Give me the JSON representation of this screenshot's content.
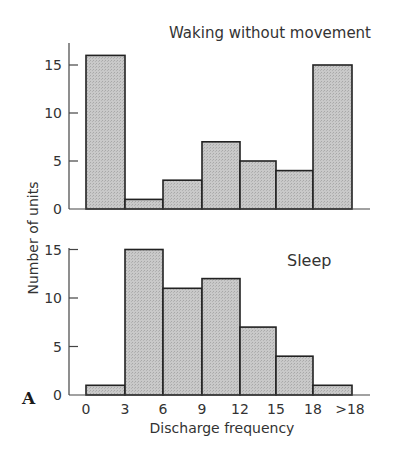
{
  "chart_data": [
    {
      "type": "bar",
      "title": "Waking without movement",
      "xlabel": "Discharge frequency",
      "ylabel": "Number of units",
      "categories": [
        "0-3",
        "3-6",
        "6-9",
        "9-12",
        "12-15",
        "15-18",
        ">18"
      ],
      "values": [
        16,
        1,
        3,
        7,
        5,
        4,
        15
      ],
      "yticks": [
        0,
        5,
        10,
        15
      ],
      "ylim": [
        0,
        17
      ],
      "grid": false
    },
    {
      "type": "bar",
      "title": "Sleep",
      "xlabel": "Discharge frequency",
      "ylabel": "Number of units",
      "categories": [
        "0-3",
        "3-6",
        "6-9",
        "9-12",
        "12-15",
        "15-18",
        ">18"
      ],
      "values": [
        1,
        15,
        11,
        12,
        7,
        4,
        1
      ],
      "yticks": [
        0,
        5,
        10,
        15
      ],
      "xticks": [
        "0",
        "3",
        "6",
        "9",
        "12",
        "15",
        "18",
        ">18"
      ],
      "ylim": [
        0,
        16
      ],
      "grid": false
    }
  ],
  "labels": {
    "top_title": "Waking without movement",
    "bottom_title": "Sleep",
    "ylabel": "Number of units",
    "xlabel": "Discharge frequency",
    "panel_letter": "A"
  },
  "colors": {
    "bar_fill": "#c4c4c4",
    "bar_stroke": "#222222",
    "axis": "#444444"
  }
}
